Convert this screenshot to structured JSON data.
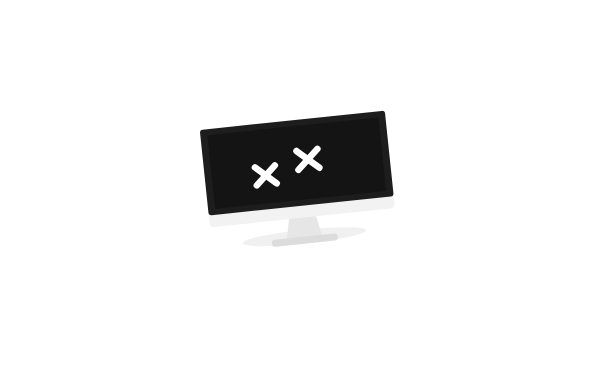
{
  "scene": {
    "title": "Computer virus infection illustration",
    "width": 613,
    "height": 368,
    "background_color": "#ffffff",
    "description": "A dead computer monitor with X eyes surrounded by fourteen purple cartoon virus germ characters"
  },
  "palette": {
    "purple": "#6E2677",
    "purple_dark": "#5E1F66",
    "orange": "#EFA534",
    "orange_bright": "#F5A623",
    "white": "#ffffff",
    "screen_black": "#141414",
    "bezel_black": "#1d1d1d",
    "monitor_body": "#efefef",
    "monitor_stand": "#e2e2e2",
    "spear_shaft": "#8c8c8c",
    "antenna_black": "#1a1a1a"
  },
  "monitor": {
    "name": "Dead computer monitor",
    "screen_color": "#141414",
    "eye_symbol": "X",
    "eyes": [
      "X",
      "X"
    ],
    "rotation_deg": -6,
    "state": "crashed"
  },
  "characters": [
    {
      "id": "germ-top-left",
      "name": "Small germ top-left",
      "type": "round-germ",
      "face": "happy-grin",
      "eye_color": "#EFA534",
      "body_color": "#6E2677",
      "antennae": 2,
      "x": 137,
      "y": 47,
      "radius": 20
    },
    {
      "id": "virus-warrior-top",
      "name": "Spear-wielding virus warrior",
      "type": "legged-virus",
      "face": "evil-smirk",
      "eye_color": "#ffffff",
      "nose_color": "#EFA534",
      "body_color": "#6E2677",
      "antennae": 3,
      "weapon": "spear",
      "weapon_tip_color": "#F5A623",
      "x": 240,
      "y": 78,
      "radius": 27
    },
    {
      "id": "germ-upper-left-2",
      "name": "Small germ upper-left second",
      "type": "round-germ",
      "face": "sad-open-mouth",
      "eye_color": "#EFA534",
      "body_color": "#6E2677",
      "antennae": 2,
      "x": 137,
      "y": 131,
      "radius": 20
    },
    {
      "id": "germ-plain-center-left",
      "name": "Faceless germ center-left",
      "type": "round-germ-blank",
      "face": "none",
      "body_color": "#6E2677",
      "antennae": 2,
      "x": 177,
      "y": 181,
      "radius": 19
    },
    {
      "id": "cloud-left",
      "name": "Cloud ghost left",
      "type": "cloud-ghost",
      "face": "orange-eyes-grin",
      "eye_color": "#EFA534",
      "body_color": "#6E2677",
      "x": 57,
      "y": 200,
      "scale": 1.0
    },
    {
      "id": "germ-bottom-left",
      "name": "Small germ bottom-left",
      "type": "round-germ",
      "face": "happy-grin",
      "eye_color": "#EFA534",
      "body_color": "#6E2677",
      "antennae": 2,
      "x": 146,
      "y": 277,
      "radius": 22
    },
    {
      "id": "cloud-bottom-center",
      "name": "Cloud ghost bottom-center",
      "type": "cloud-ghost",
      "face": "orange-eyes-grin",
      "eye_color": "#EFA534",
      "body_color": "#6E2677",
      "x": 262,
      "y": 290,
      "scale": 1.05
    },
    {
      "id": "germ-top-right",
      "name": "Small germ top-right",
      "type": "round-germ",
      "face": "sleepy-smirk",
      "eye_color": "#EFA534",
      "body_color": "#6E2677",
      "antennae": 2,
      "x": 397,
      "y": 85,
      "radius": 22
    },
    {
      "id": "cloud-big-right",
      "name": "Large cloud ghost right",
      "type": "cloud-ghost-large",
      "face": "orange-eyes-grin",
      "eye_color": "#EFA534",
      "body_color": "#6E2677",
      "x": 518,
      "y": 95,
      "scale": 2.0
    },
    {
      "id": "germ-mid-right",
      "name": "Small germ middle-right",
      "type": "round-germ",
      "face": "sad-open-mouth",
      "eye_color": "#EFA534",
      "body_color": "#6E2677",
      "antennae": 2,
      "x": 424,
      "y": 181,
      "radius": 20
    },
    {
      "id": "germ-plain-right",
      "name": "Faceless germ right",
      "type": "round-germ-blank",
      "face": "none",
      "body_color": "#6E2677",
      "antennae": 2,
      "x": 515,
      "y": 196,
      "radius": 20
    },
    {
      "id": "germ-bottom-right",
      "name": "Small germ bottom-right",
      "type": "round-germ",
      "face": "happy-grin",
      "eye_color": "#EFA534",
      "body_color": "#6E2677",
      "antennae": 2,
      "x": 402,
      "y": 257,
      "radius": 20
    },
    {
      "id": "virus-warrior-bottom",
      "name": "Spear-wielding virus warrior bottom-right",
      "type": "legged-virus-blank",
      "face": "none",
      "body_color": "#6E2677",
      "antennae": 2,
      "weapon": "spear",
      "weapon_tip_color": "#F5A623",
      "x": 478,
      "y": 270,
      "radius": 28
    }
  ],
  "counts": {
    "total_characters": 13,
    "cloud_ghosts": 3,
    "round_germs": 8,
    "legged_viruses": 2,
    "monitors": 1
  }
}
